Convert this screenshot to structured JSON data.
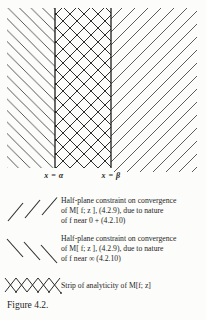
{
  "figure": {
    "caption": "Figure 4.2.",
    "diagram": {
      "alpha_boundary_label": "x = α",
      "beta_boundary_label": "x = β"
    },
    "legend": [
      {
        "symbol": "forward-slash-hatch-icon",
        "lines": [
          "Half-plane constraint on convergence",
          "of M[ f; z ], (4.2.9), due to nature",
          "of f near 0 + (4.2.10)"
        ]
      },
      {
        "symbol": "back-slash-hatch-icon",
        "lines": [
          "Half-plane constraint on convergence",
          "of M[ f; z ], (4.2.9), due to nature",
          "of f near ∞ (4.2.10)"
        ]
      },
      {
        "symbol": "cross-hatch-icon",
        "lines": [
          "Strip of analyticity of M[f; z]"
        ]
      }
    ],
    "colors": {
      "ink": "#2b2b2b",
      "hatch": "#454545",
      "paper": "#fcfcfa"
    }
  }
}
